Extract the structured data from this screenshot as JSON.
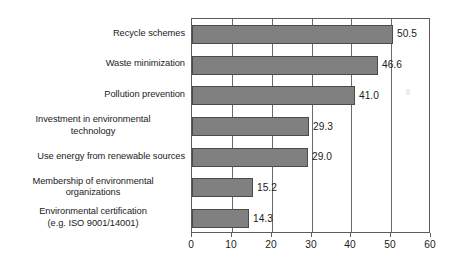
{
  "chart_data": {
    "type": "bar",
    "orientation": "horizontal",
    "title": "",
    "subtitle": "",
    "xlabel": "",
    "ylabel": "",
    "xlim": [
      0,
      60
    ],
    "xticks": [
      "0",
      "10",
      "20",
      "30",
      "40",
      "50",
      "60"
    ],
    "xtick_values": [
      0,
      10,
      20,
      30,
      40,
      50,
      60
    ],
    "grid": "vertical",
    "legend": "none",
    "bar_color": "#808080",
    "bar_border_color": "#4b4b4b",
    "axis_color": "#5c5c5c",
    "background": "#ffffff",
    "categories": [
      "Recycle schemes",
      "Waste minimization",
      "Pollution prevention",
      "Investment in environmental\ntechnology",
      "Use energy from renewable sources",
      "Membership of environmental\norganizations",
      "Environmental certification\n(e.g. ISO 9001/14001)"
    ],
    "values": [
      50.5,
      46.6,
      41.0,
      29.3,
      29.0,
      15.2,
      14.3
    ],
    "value_labels": [
      "50.5",
      "46.6",
      "41.0",
      "29.3",
      "29.0",
      "15.2",
      "14.3"
    ],
    "bars": [
      {
        "label": "Recycle schemes",
        "value": 50.5,
        "value_label": "50.5",
        "multiline": false
      },
      {
        "label": "Waste minimization",
        "value": 46.6,
        "value_label": "46.6",
        "multiline": false
      },
      {
        "label": "Pollution prevention",
        "value": 41.0,
        "value_label": "41.0",
        "multiline": false
      },
      {
        "label": "Investment in environmental\ntechnology",
        "value": 29.3,
        "value_label": "29.3",
        "multiline": true
      },
      {
        "label": "Use energy from renewable sources",
        "value": 29.0,
        "value_label": "29.0",
        "multiline": false
      },
      {
        "label": "Membership of environmental\norganizations",
        "value": 15.2,
        "value_label": "15.2",
        "multiline": true
      },
      {
        "label": "Environmental certification\n(e.g. ISO 9001/14001)",
        "value": 14.3,
        "value_label": "14.3",
        "multiline": true
      }
    ]
  }
}
